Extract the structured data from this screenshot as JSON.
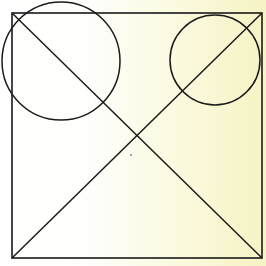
{
  "canvas": {
    "width": 266,
    "height": 266
  },
  "colors": {
    "stroke": "#1a1a1a",
    "background_left": "#ffffff",
    "background_right": "#f6f3c4"
  },
  "diagram": {
    "square": {
      "x": 12,
      "y": 13,
      "width": 250,
      "height": 245
    },
    "diagonals": [
      {
        "x1": 12,
        "y1": 13,
        "x2": 262,
        "y2": 258
      },
      {
        "x1": 262,
        "y1": 13,
        "x2": 12,
        "y2": 258
      }
    ],
    "circles": [
      {
        "id": "left-circle",
        "cx": 61,
        "cy": 61,
        "r": 59
      },
      {
        "id": "right-circle",
        "cx": 215,
        "cy": 60,
        "r": 45
      }
    ],
    "dot": {
      "cx": 131,
      "cy": 155,
      "r": 0.9
    }
  }
}
